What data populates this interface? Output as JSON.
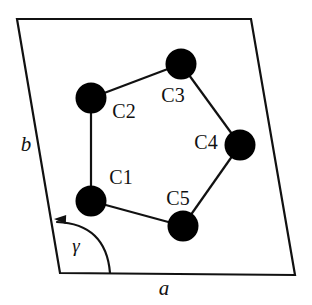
{
  "figure": {
    "background_color": "#ffffff",
    "stroke_color": "#111111",
    "atom_fill_color": "#000000",
    "width": 312,
    "height": 305
  },
  "unit_cell": {
    "name": "unit-cell-parallelogram",
    "corners": [
      {
        "name": "top-left",
        "x": 17,
        "y": 19
      },
      {
        "name": "top-right",
        "x": 251,
        "y": 19
      },
      {
        "name": "bottom-right",
        "x": 295,
        "y": 275
      },
      {
        "name": "bottom-left",
        "x": 60,
        "y": 273
      }
    ],
    "stroke_width": 2.2
  },
  "axes": [
    {
      "id": "b",
      "label": "b",
      "x": 26,
      "y": 146,
      "style": "italic"
    },
    {
      "id": "a",
      "label": "a",
      "x": 164,
      "y": 290,
      "style": "italic"
    }
  ],
  "angle": {
    "id": "gamma",
    "label": "γ",
    "x": 76,
    "y": 248,
    "arc": {
      "start_x": 110,
      "start_y": 273,
      "end_x": 57,
      "end_y": 222,
      "control_x": 106,
      "control_y": 224,
      "arrow_tip_x": 54,
      "arrow_tip_y": 219
    }
  },
  "molecule": {
    "name": "cyclopentane-ring",
    "atom_radius": 15.5,
    "bond_width": 2.2,
    "atoms": [
      {
        "id": "C1",
        "label": "C1",
        "cx": 91,
        "cy": 201,
        "label_x": 121,
        "label_y": 179
      },
      {
        "id": "C2",
        "label": "C2",
        "cx": 91,
        "cy": 98,
        "label_x": 124,
        "label_y": 113
      },
      {
        "id": "C3",
        "label": "C3",
        "cx": 181,
        "cy": 64,
        "label_x": 173,
        "label_y": 97
      },
      {
        "id": "C4",
        "label": "C4",
        "cx": 240,
        "cy": 145,
        "label_x": 206,
        "label_y": 144
      },
      {
        "id": "C5",
        "label": "C5",
        "cx": 183,
        "cy": 226,
        "label_x": 178,
        "label_y": 200
      }
    ],
    "bonds": [
      {
        "from": "C1",
        "to": "C2"
      },
      {
        "from": "C2",
        "to": "C3"
      },
      {
        "from": "C3",
        "to": "C4"
      },
      {
        "from": "C4",
        "to": "C5"
      },
      {
        "from": "C5",
        "to": "C1"
      }
    ]
  }
}
